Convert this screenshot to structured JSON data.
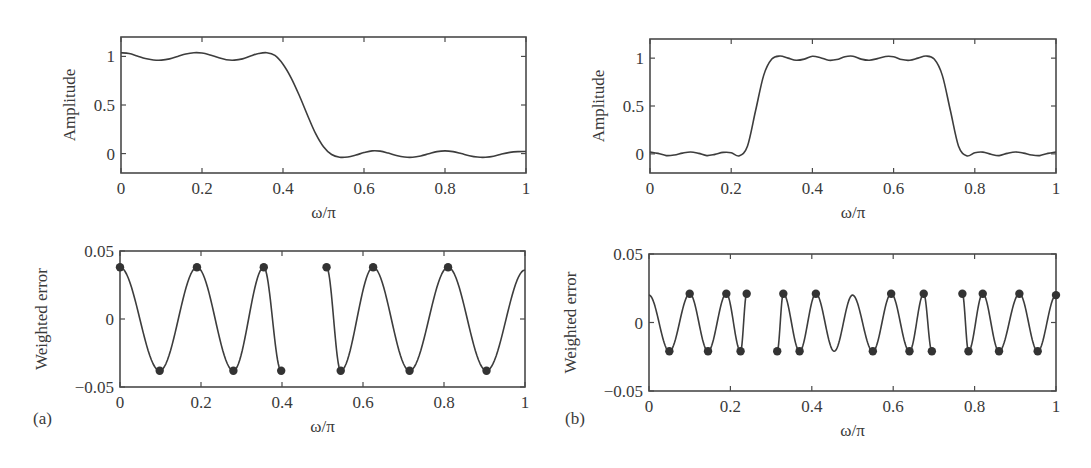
{
  "figure": {
    "panel_labels": [
      "(a)",
      "(b)"
    ]
  },
  "chart_data": [
    {
      "id": "a-top",
      "type": "line",
      "panel": "(a)",
      "title": "",
      "xlabel": "ω/π",
      "ylabel": "Amplitude",
      "xlim": [
        0,
        1
      ],
      "ylim": [
        -0.2,
        1.2
      ],
      "xticks": [
        0,
        0.2,
        0.4,
        0.6,
        0.8,
        1
      ],
      "xtick_labels": [
        "0",
        "0.2",
        "0.4",
        "0.6",
        "0.8",
        "1"
      ],
      "yticks": [
        0,
        0.5,
        1
      ],
      "ytick_labels": [
        "0",
        "0.5",
        "1"
      ],
      "grid": false,
      "description": "Lowpass equiripple filter amplitude response; passband 0–0.4π, stopband 0.5–1π",
      "series": [
        {
          "name": "amplitude",
          "x": [
            0,
            0.02,
            0.04,
            0.06,
            0.08,
            0.1,
            0.12,
            0.14,
            0.16,
            0.18,
            0.2,
            0.22,
            0.24,
            0.26,
            0.28,
            0.3,
            0.32,
            0.34,
            0.36,
            0.38,
            0.4,
            0.42,
            0.44,
            0.46,
            0.48,
            0.5,
            0.52,
            0.54,
            0.56,
            0.58,
            0.6,
            0.62,
            0.64,
            0.66,
            0.68,
            0.7,
            0.72,
            0.74,
            0.76,
            0.78,
            0.8,
            0.82,
            0.84,
            0.86,
            0.88,
            0.9,
            0.92,
            0.94,
            0.96,
            0.98,
            1
          ],
          "y": [
            1.038,
            1.03,
            1.005,
            0.978,
            0.964,
            0.962,
            0.975,
            1.0,
            1.025,
            1.038,
            1.035,
            1.015,
            0.988,
            0.966,
            0.962,
            0.975,
            1.005,
            1.03,
            1.038,
            1.01,
            0.92,
            0.78,
            0.6,
            0.4,
            0.21,
            0.07,
            -0.01,
            -0.038,
            -0.035,
            -0.015,
            0.01,
            0.028,
            0.025,
            0.005,
            -0.02,
            -0.036,
            -0.038,
            -0.025,
            -0.002,
            0.02,
            0.028,
            0.02,
            0.0,
            -0.022,
            -0.036,
            -0.038,
            -0.028,
            -0.005,
            0.012,
            0.02,
            0.022
          ]
        }
      ]
    },
    {
      "id": "b-top",
      "type": "line",
      "panel": "(b)",
      "title": "",
      "xlabel": "ω/π",
      "ylabel": "Amplitude",
      "xlim": [
        0,
        1
      ],
      "ylim": [
        -0.2,
        1.2
      ],
      "xticks": [
        0,
        0.2,
        0.4,
        0.6,
        0.8,
        1
      ],
      "xtick_labels": [
        "0",
        "0.2",
        "0.4",
        "0.6",
        "0.8",
        "1"
      ],
      "yticks": [
        0,
        0.5,
        1
      ],
      "ytick_labels": [
        "0",
        "0.5",
        "1"
      ],
      "grid": false,
      "description": "Bandpass equiripple filter amplitude response; passband ~0.3–0.7π",
      "series": [
        {
          "name": "amplitude",
          "x": [
            0,
            0.02,
            0.04,
            0.06,
            0.08,
            0.1,
            0.12,
            0.14,
            0.16,
            0.18,
            0.2,
            0.22,
            0.24,
            0.26,
            0.28,
            0.3,
            0.32,
            0.34,
            0.36,
            0.38,
            0.4,
            0.42,
            0.44,
            0.46,
            0.48,
            0.5,
            0.52,
            0.54,
            0.56,
            0.58,
            0.6,
            0.62,
            0.64,
            0.66,
            0.68,
            0.7,
            0.72,
            0.74,
            0.76,
            0.78,
            0.8,
            0.82,
            0.84,
            0.86,
            0.88,
            0.9,
            0.92,
            0.94,
            0.96,
            0.98,
            1
          ],
          "y": [
            0.02,
            0.005,
            -0.018,
            -0.012,
            0.008,
            0.02,
            0.005,
            -0.018,
            -0.005,
            0.015,
            0.012,
            -0.02,
            0.08,
            0.45,
            0.82,
            0.99,
            1.022,
            1.0,
            0.978,
            0.99,
            1.02,
            1.005,
            0.978,
            0.985,
            1.015,
            1.02,
            0.99,
            0.978,
            0.995,
            1.018,
            1.015,
            0.985,
            0.978,
            1.0,
            1.022,
            0.99,
            0.82,
            0.45,
            0.08,
            -0.02,
            0.012,
            0.018,
            -0.005,
            -0.018,
            0.005,
            0.02,
            0.008,
            -0.012,
            -0.018,
            0.005,
            0.02
          ]
        }
      ]
    },
    {
      "id": "a-bottom",
      "type": "line",
      "panel": "(a)",
      "title": "",
      "xlabel": "ω/π",
      "ylabel": "Weighted error",
      "xlim": [
        0,
        1
      ],
      "ylim": [
        -0.05,
        0.05
      ],
      "xticks": [
        0,
        0.2,
        0.4,
        0.6,
        0.8,
        1
      ],
      "xtick_labels": [
        "0",
        "0.2",
        "0.4",
        "0.6",
        "0.8",
        "1"
      ],
      "yticks": [
        -0.05,
        0,
        0.05
      ],
      "ytick_labels": [
        "−0.05",
        "0",
        "0.05"
      ],
      "grid": false,
      "description": "Weighted error of lowpass design with extremal frequencies marked; transition band 0.4–0.5 omitted",
      "segments": [
        {
          "band": [
            0,
            0.4
          ],
          "amplitude": 0.038,
          "start_phase": "max",
          "extremal_count": 6
        },
        {
          "band": [
            0.5,
            1
          ],
          "amplitude": 0.038,
          "start_phase": "max",
          "extremal_count": 6
        }
      ],
      "extremal_points": [
        {
          "x": 0.0,
          "y": 0.038
        },
        {
          "x": 0.098,
          "y": -0.038
        },
        {
          "x": 0.19,
          "y": 0.038
        },
        {
          "x": 0.28,
          "y": -0.038
        },
        {
          "x": 0.355,
          "y": 0.038
        },
        {
          "x": 0.398,
          "y": -0.038
        },
        {
          "x": 0.51,
          "y": 0.038
        },
        {
          "x": 0.545,
          "y": -0.038
        },
        {
          "x": 0.625,
          "y": 0.038
        },
        {
          "x": 0.715,
          "y": -0.038
        },
        {
          "x": 0.81,
          "y": 0.038
        },
        {
          "x": 0.905,
          "y": -0.038
        }
      ],
      "end_value": {
        "x": 1.0,
        "y": 0.036
      }
    },
    {
      "id": "b-bottom",
      "type": "line",
      "panel": "(b)",
      "title": "",
      "xlabel": "ω/π",
      "ylabel": "Weighted error",
      "xlim": [
        0,
        1
      ],
      "ylim": [
        -0.05,
        0.05
      ],
      "xticks": [
        0,
        0.2,
        0.4,
        0.6,
        0.8,
        1
      ],
      "xtick_labels": [
        "0",
        "0.2",
        "0.4",
        "0.6",
        "0.8",
        "1"
      ],
      "yticks": [
        -0.05,
        0,
        0.05
      ],
      "ytick_labels": [
        "−0.05",
        "0",
        "0.05"
      ],
      "grid": false,
      "description": "Weighted error of bandpass design with extremal frequencies marked; transition bands omitted",
      "segments": [
        {
          "band": [
            0,
            0.24
          ]
        },
        {
          "band": [
            0.315,
            0.695
          ]
        },
        {
          "band": [
            0.77,
            1
          ]
        }
      ],
      "start_value": {
        "x": 0.0,
        "y": 0.02
      },
      "extremal_points": [
        {
          "x": 0.05,
          "y": -0.021
        },
        {
          "x": 0.1,
          "y": 0.021
        },
        {
          "x": 0.145,
          "y": -0.021
        },
        {
          "x": 0.19,
          "y": 0.021
        },
        {
          "x": 0.225,
          "y": -0.021
        },
        {
          "x": 0.24,
          "y": 0.021
        },
        {
          "x": 0.315,
          "y": -0.021
        },
        {
          "x": 0.33,
          "y": 0.021
        },
        {
          "x": 0.37,
          "y": -0.021
        },
        {
          "x": 0.41,
          "y": 0.021
        },
        {
          "x": 0.55,
          "y": -0.021
        },
        {
          "x": 0.595,
          "y": 0.021
        },
        {
          "x": 0.64,
          "y": -0.021
        },
        {
          "x": 0.675,
          "y": 0.021
        },
        {
          "x": 0.695,
          "y": -0.021
        },
        {
          "x": 0.77,
          "y": 0.021
        },
        {
          "x": 0.785,
          "y": -0.021
        },
        {
          "x": 0.82,
          "y": 0.021
        },
        {
          "x": 0.86,
          "y": -0.021
        },
        {
          "x": 0.91,
          "y": 0.021
        },
        {
          "x": 0.955,
          "y": -0.021
        },
        {
          "x": 1.0,
          "y": 0.02
        }
      ],
      "unmarked_extrema": [
        {
          "x": 0.455,
          "y": -0.021
        },
        {
          "x": 0.5,
          "y": 0.02
        }
      ]
    }
  ]
}
